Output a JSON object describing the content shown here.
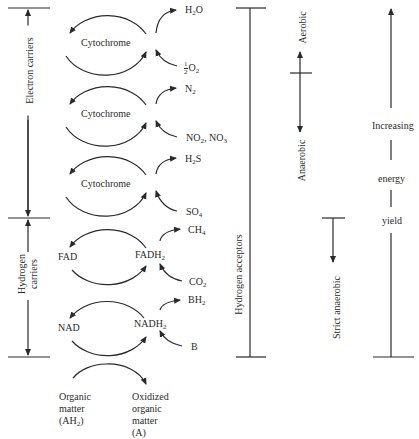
{
  "diagram": {
    "carriers": [
      {
        "label": "Cytochrome",
        "cy": 43
      },
      {
        "label": "Cytochrome",
        "cy": 114
      },
      {
        "label": "Cytochrome",
        "cy": 184
      },
      {
        "left_label": "FAD",
        "right_label_base": "FADH",
        "right_label_sub": "2",
        "cy": 257
      },
      {
        "left_label": "NAD",
        "right_label_base": "NADH",
        "right_label_sub": "2",
        "cy": 328
      }
    ],
    "acceptor_pairs": [
      {
        "product_base": "H",
        "product_sub": "2",
        "product_tail": "O",
        "reactant_frac_num": "1",
        "reactant_frac_den": "2",
        "reactant_base": "O",
        "reactant_sub": "2"
      },
      {
        "product_base": "N",
        "product_sub": "2",
        "product_tail": "",
        "reactant_text": "NO",
        "reactant_sub": "2",
        "reactant_tail": ", NO",
        "reactant_sub2": "3"
      },
      {
        "product_base": "H",
        "product_sub": "2",
        "product_tail": "S",
        "reactant_text": "SO",
        "reactant_sub": "4"
      },
      {
        "product_base": "CH",
        "product_sub": "4",
        "product_tail": "",
        "reactant_text": "CO",
        "reactant_sub": "2"
      },
      {
        "product_base": "BH",
        "product_sub": "2",
        "product_tail": "",
        "reactant_text": "B"
      }
    ],
    "left_brackets": {
      "electron_carriers": "Electron carriers",
      "hydrogen_carriers_line1": "Hydrogen",
      "hydrogen_carriers_line2": "carriers"
    },
    "hydrogen_acceptors_label": "Hydrogen acceptors",
    "oxygen_scale": {
      "aerobic": "Aerobic",
      "anaerobic": "Anaerobic",
      "strict_anaerobic": "Strict anaerobic"
    },
    "energy_scale": {
      "word1": "Increasing",
      "word2": "energy",
      "word3": "yield"
    },
    "bottom": {
      "organic_matter_l1": "Organic",
      "organic_matter_l2": "matter",
      "organic_matter_l3_base": "(AH",
      "organic_matter_l3_sub": "2",
      "organic_matter_l3_tail": ")",
      "oxidized_l1": "Oxidized",
      "oxidized_l2": "organic",
      "oxidized_l3": "matter",
      "oxidized_l4": "(A)"
    }
  },
  "colors": {
    "ink": "#2a2a2a",
    "background": "#ffffff"
  }
}
